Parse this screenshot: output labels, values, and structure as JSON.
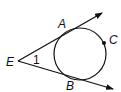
{
  "diagram": {
    "labels": {
      "A": "A",
      "B": "B",
      "C": "C",
      "E": "E",
      "angle": "1"
    },
    "colors": {
      "stroke": "#111111",
      "background": "#ffffff"
    }
  }
}
